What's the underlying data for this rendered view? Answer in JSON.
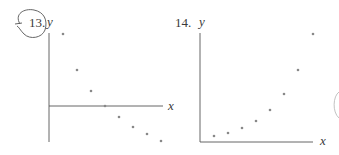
{
  "page": {
    "background": "#ffffff",
    "ink_color": "#555555",
    "point_color": "#888888"
  },
  "chart_data": [
    {
      "type": "scatter",
      "problem_number": "13.",
      "title": "",
      "xlabel": "x",
      "ylabel": "y",
      "annotation": "problem number circled by hand",
      "axes": {
        "x_axis_position": "middle (crosses y-axis partway down)",
        "y_axis_position": "left",
        "grid": false,
        "ticks": false
      },
      "description": "Decreasing linear trend; points cross x-axis at 4th point",
      "points": [
        {
          "x": 1,
          "y": 7.2
        },
        {
          "x": 2,
          "y": 3.6
        },
        {
          "x": 3,
          "y": 1.5
        },
        {
          "x": 4,
          "y": 0.0
        },
        {
          "x": 5,
          "y": -1.1
        },
        {
          "x": 6,
          "y": -2.1
        },
        {
          "x": 7,
          "y": -2.8
        },
        {
          "x": 8,
          "y": -3.5
        }
      ],
      "pixel_points": [
        [
          63,
          34
        ],
        [
          77,
          70
        ],
        [
          91,
          91
        ],
        [
          105,
          106
        ],
        [
          119,
          117
        ],
        [
          133,
          127
        ],
        [
          147,
          134
        ],
        [
          161,
          141
        ]
      ],
      "origin_px": [
        49,
        106
      ],
      "y_axis_px": {
        "x": 49,
        "y_top": 33,
        "y_bottom": 142
      },
      "x_axis_px": {
        "y": 106,
        "x_left": 49,
        "x_right": 163
      }
    },
    {
      "type": "scatter",
      "problem_number": "14.",
      "title": "",
      "xlabel": "x",
      "ylabel": "y",
      "axes": {
        "x_axis_position": "bottom",
        "y_axis_position": "left",
        "grid": false,
        "ticks": false
      },
      "description": "Increasing, upward-curving (exponential-like) trend",
      "points": [
        {
          "x": 1,
          "y": 0.6
        },
        {
          "x": 2,
          "y": 0.9
        },
        {
          "x": 3,
          "y": 1.4
        },
        {
          "x": 4,
          "y": 2.1
        },
        {
          "x": 5,
          "y": 3.2
        },
        {
          "x": 6,
          "y": 4.8
        },
        {
          "x": 7,
          "y": 7.2
        },
        {
          "x": 8,
          "y": 10.8
        }
      ],
      "pixel_points": [
        [
          214,
          136
        ],
        [
          228,
          133
        ],
        [
          242,
          128
        ],
        [
          256,
          121
        ],
        [
          270,
          110
        ],
        [
          284,
          94
        ],
        [
          298,
          70
        ],
        [
          313,
          34
        ]
      ],
      "origin_px": [
        200,
        142
      ],
      "y_axis_px": {
        "x": 200,
        "y_top": 33,
        "y_bottom": 142
      },
      "x_axis_px": {
        "y": 142,
        "x_left": 200,
        "x_right": 313
      }
    }
  ],
  "labels": {
    "plot13": {
      "number": "13.",
      "y": "y",
      "x": "x"
    },
    "plot14": {
      "number": "14.",
      "y": "y",
      "x": "x"
    }
  }
}
